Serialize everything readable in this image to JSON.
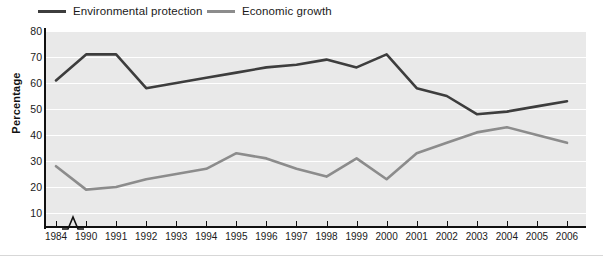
{
  "chart_data": {
    "type": "line",
    "title": "",
    "xlabel": "",
    "ylabel": "Percentage",
    "ylim": [
      0,
      80
    ],
    "yticks": [
      10,
      20,
      30,
      40,
      50,
      60,
      70,
      80
    ],
    "grid": true,
    "legend_position": "top-left",
    "axis_break": "between 1984 and 1990",
    "categories": [
      "1984",
      "1990",
      "1991",
      "1992",
      "1993",
      "1994",
      "1995",
      "1996",
      "1997",
      "1998",
      "1999",
      "2000",
      "2001",
      "2002",
      "2003",
      "2004",
      "2005",
      "2006"
    ],
    "series": [
      {
        "name": "Environmental protection",
        "color": "#3d3d3d",
        "values": [
          61,
          71,
          71,
          58,
          60,
          62,
          64,
          66,
          67,
          69,
          66,
          71,
          58,
          55,
          48,
          49,
          51,
          53
        ]
      },
      {
        "name": "Economic growth",
        "color": "#8c8c8c",
        "values": [
          28,
          19,
          20,
          23,
          25,
          27,
          33,
          31,
          27,
          24,
          31,
          23,
          33,
          37,
          41,
          43,
          40,
          37
        ]
      }
    ]
  },
  "legend": {
    "items": [
      {
        "label": "Environmental protection",
        "color": "#3d3d3d"
      },
      {
        "label": "Economic growth",
        "color": "#8c8c8c"
      }
    ]
  },
  "axes": {
    "y_title": "Percentage",
    "y_tick_labels": [
      "80",
      "70",
      "60",
      "50",
      "40",
      "30",
      "20",
      "10"
    ],
    "x_tick_labels": [
      "1984",
      "1990",
      "1991",
      "1992",
      "1993",
      "1994",
      "1995",
      "1996",
      "1997",
      "1998",
      "1999",
      "2000",
      "2001",
      "2002",
      "2003",
      "2004",
      "2005",
      "2006"
    ]
  }
}
